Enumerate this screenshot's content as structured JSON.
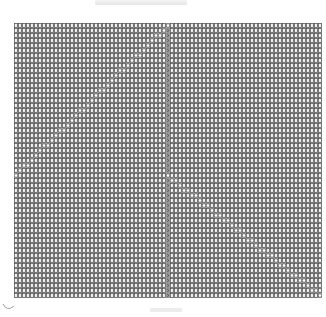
{
  "header": {
    "title_text": ""
  },
  "footer": {
    "caption_text": ""
  },
  "grid": {
    "columns": 77,
    "rows": 55,
    "cell_glyph": "box",
    "marker_glyph": "circle",
    "center_column": 38,
    "colors": {
      "background": "#9a9a9a",
      "cell_fill": "#f2f2f2",
      "cell_stroke": "#2e2e2e",
      "marker": "#ffffff",
      "center_mark": "#3a3a3a"
    },
    "diagonals": [
      {
        "name": "upper-left-diagonal",
        "start": [
          38,
          0
        ],
        "end": [
          0,
          30
        ]
      },
      {
        "name": "lower-right-diagonal",
        "start": [
          38,
          30
        ],
        "end": [
          76,
          54
        ]
      }
    ]
  }
}
